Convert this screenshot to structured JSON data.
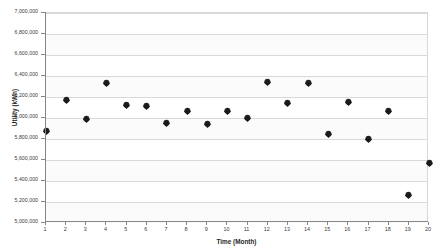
{
  "chart_data": {
    "type": "scatter",
    "title": "",
    "xlabel": "Time (Month)",
    "ylabel": "Utility (kWh)",
    "xlim": [
      1,
      20
    ],
    "ylim": [
      5000000,
      7000000
    ],
    "grid": true,
    "legend": "none",
    "x": [
      1,
      2,
      3,
      4,
      5,
      6,
      7,
      8,
      9,
      10,
      11,
      12,
      13,
      14,
      15,
      16,
      17,
      18,
      19,
      20
    ],
    "values": [
      5870000,
      6165000,
      5985000,
      6330000,
      6115000,
      6105000,
      5950000,
      6060000,
      5935000,
      6060000,
      5995000,
      6335000,
      6135000,
      6330000,
      5840000,
      6150000,
      5800000,
      6065000,
      5265000,
      5565000
    ],
    "y_ticks": [
      "5,000,000",
      "5,200,000",
      "5,400,000",
      "5,600,000",
      "5,800,000",
      "6,000,000",
      "6,200,000",
      "6,400,000",
      "6,600,000",
      "6,800,000",
      "7,000,000"
    ],
    "y_tick_values": [
      5000000,
      5200000,
      5400000,
      5600000,
      5800000,
      6000000,
      6200000,
      6400000,
      6600000,
      6800000,
      7000000
    ],
    "x_ticks": [
      "1",
      "2",
      "3",
      "4",
      "5",
      "6",
      "7",
      "8",
      "9",
      "10",
      "11",
      "12",
      "13",
      "14",
      "15",
      "16",
      "17",
      "18",
      "19",
      "20"
    ],
    "marker_color": "#1a1a1a",
    "gridline_color": "#d9d9d9",
    "axis_color": "#868686",
    "plot_background": "#ffffff"
  }
}
